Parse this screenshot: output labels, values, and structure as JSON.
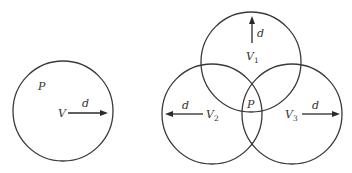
{
  "diagram": {
    "stroke_color": "#3a3a3a",
    "background": "#ffffff",
    "left": {
      "circle": {
        "cx": 63,
        "cy": 111,
        "r": 50
      },
      "point_label": "P",
      "vehicle_label": "V",
      "range_label": "d",
      "arrow": {
        "x1": 68,
        "y1": 113,
        "x2": 107,
        "y2": 113,
        "direction": "right"
      }
    },
    "right": {
      "point_label": "P",
      "circles": [
        {
          "id": "V1",
          "label": "V",
          "subscript": "1",
          "cx": 251,
          "cy": 62,
          "r": 50,
          "range_label": "d",
          "arrow": {
            "x1": 252,
            "y1": 42,
            "x2": 252,
            "y2": 16,
            "direction": "up"
          }
        },
        {
          "id": "V2",
          "label": "V",
          "subscript": "2",
          "cx": 212,
          "cy": 114,
          "r": 50,
          "range_label": "d",
          "arrow": {
            "x1": 203,
            "y1": 114,
            "x2": 165,
            "y2": 114,
            "direction": "left"
          }
        },
        {
          "id": "V3",
          "label": "V",
          "subscript": "3",
          "cx": 292,
          "cy": 114,
          "r": 50,
          "range_label": "d",
          "arrow": {
            "x1": 302,
            "y1": 114,
            "x2": 339,
            "y2": 114,
            "direction": "right"
          }
        }
      ]
    }
  }
}
